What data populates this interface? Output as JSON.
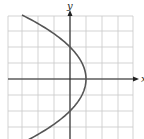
{
  "chart_data": {
    "type": "line",
    "title": "",
    "xlabel": "x",
    "ylabel": "y",
    "xlim": [
      -4,
      4
    ],
    "ylim": [
      -4,
      4
    ],
    "grid": true,
    "grid_step": 1,
    "series": [
      {
        "name": "parabola x = 1 - y^2/4",
        "equation": "x = 1 - y^2/4",
        "points": [
          {
            "x": -3,
            "y": 4
          },
          {
            "x": -1.25,
            "y": 3
          },
          {
            "x": 0,
            "y": 2
          },
          {
            "x": 0.75,
            "y": 1
          },
          {
            "x": 1,
            "y": 0
          },
          {
            "x": 0.75,
            "y": -1
          },
          {
            "x": 0,
            "y": -2
          },
          {
            "x": -1.25,
            "y": -3
          },
          {
            "x": -3,
            "y": -4
          }
        ],
        "color": "#555555"
      }
    ]
  }
}
